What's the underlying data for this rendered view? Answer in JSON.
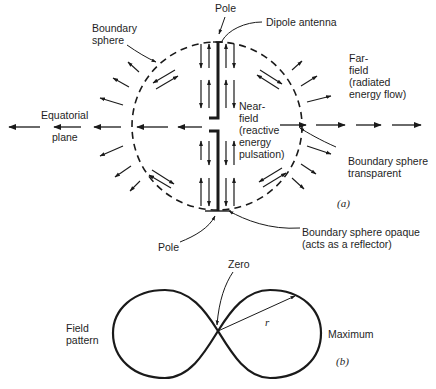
{
  "figure_a": {
    "caption": "(a)",
    "labels": {
      "pole_top": "Pole",
      "dipole_antenna": "Dipole antenna",
      "boundary_sphere": "Boundary\nsphere",
      "far_field": "Far-\nfield\n(radiated\nenergy flow)",
      "equatorial_plane_1": "Equatorial",
      "equatorial_plane_2": "plane",
      "near_field": "Near-\nfield\n(reactive\nenergy\npulsation)",
      "boundary_transparent": "Boundary sphere\ntransparent",
      "pole_bottom": "Pole",
      "boundary_opaque": "Boundary sphere opaque\n(acts as a reflector)"
    }
  },
  "figure_b": {
    "caption": "(b)",
    "labels": {
      "zero": "Zero",
      "field_pattern": "Field\npattern",
      "radius": "r",
      "maximum": "Maximum"
    }
  },
  "colors": {
    "ink": "#1a1a1a",
    "background": "#ffffff"
  }
}
